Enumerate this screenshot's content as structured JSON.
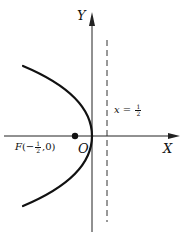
{
  "diagram": {
    "type": "parabola",
    "equation_implied": "y^2 = -2x",
    "colors": {
      "stroke": "#111111",
      "background": "#ffffff"
    },
    "axes": {
      "x_label": "X",
      "y_label": "Y",
      "origin_label": "O"
    },
    "directrix": {
      "label_var": "x",
      "label_eq": "=",
      "label_num": "1",
      "label_den": "2",
      "style": "dashed"
    },
    "focus": {
      "label_name": "F",
      "label_open": "(",
      "label_sign": "−",
      "label_num": "1",
      "label_den": "2",
      "label_rest": ",0)"
    }
  }
}
